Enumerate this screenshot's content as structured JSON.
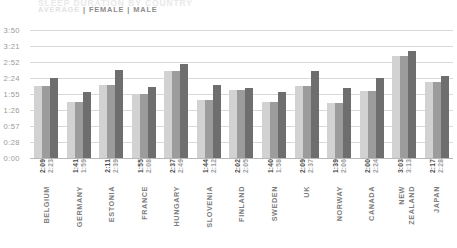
{
  "header": {
    "title": "SLEEP DURATION BY COUNTRY",
    "legend": {
      "average": "AVERAGE",
      "separator": "|",
      "female": "FEMALE",
      "male": "MALE"
    }
  },
  "colors": {
    "average_bar": "#d2d2d2",
    "female_bar": "#9c9c9c",
    "male_bar": "#6e6e6e",
    "gridline": "#d9d9d9",
    "axis_text": "#9a9a9a",
    "category_text": "#7d7d7d"
  },
  "chart_data": {
    "type": "bar",
    "title": "SLEEP DURATION BY COUNTRY",
    "xlabel": "",
    "ylabel": "",
    "grid": true,
    "legend_position": "top-left",
    "ylim": [
      0,
      230
    ],
    "ytick_labels": [
      "3:50",
      "3:21",
      "2:52",
      "2:24",
      "1:55",
      "1:26",
      "0:57",
      "0:28",
      "0:00"
    ],
    "ytick_values": [
      230,
      201,
      172,
      144,
      115,
      86,
      57,
      28,
      0
    ],
    "categories": [
      "BELGIUM",
      "GERMANY",
      "ESTONIA",
      "FRANCE",
      "HUNGARY",
      "SLOVENIA",
      "FINLAND",
      "SWEDEN",
      "UK",
      "NORWAY",
      "CANADA",
      "NEW ZEALAND",
      "JAPAN"
    ],
    "series": [
      {
        "name": "AVERAGE",
        "color": "#d2d2d2",
        "labels": [
          "2:09",
          "1:41",
          "2:11",
          "1:55",
          "2:37",
          "1:44",
          "2:02",
          "1:40",
          "2:09",
          "1:39",
          "2:00",
          "3:03",
          "2:17"
        ],
        "values": [
          129,
          101,
          131,
          115,
          157,
          104,
          122,
          100,
          129,
          99,
          120,
          183,
          137
        ]
      },
      {
        "name": "FEMALE",
        "color": "#9c9c9c",
        "labels": [
          "2:09",
          "1:41",
          "2:11",
          "1:55",
          "2:37",
          "1:44",
          "2:02",
          "1:40",
          "2:09",
          "1:39",
          "2:00",
          "3:03",
          "2:17"
        ],
        "values": [
          129,
          101,
          131,
          115,
          157,
          104,
          122,
          100,
          129,
          99,
          120,
          183,
          137
        ]
      },
      {
        "name": "MALE",
        "color": "#6e6e6e",
        "labels": [
          "2:23",
          "1:59",
          "2:39",
          "2:08",
          "2:49",
          "2:12",
          "2:05",
          "1:58",
          "2:37",
          "2:06",
          "2:24",
          "3:13",
          "2:28"
        ],
        "values": [
          143,
          119,
          159,
          128,
          169,
          132,
          125,
          118,
          157,
          126,
          144,
          193,
          148
        ]
      }
    ]
  }
}
